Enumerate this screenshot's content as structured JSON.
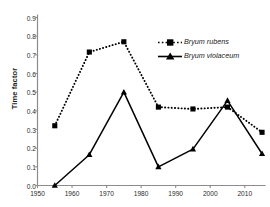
{
  "caption": {
    "top_fragment": ""
  },
  "chart_data": {
    "type": "line",
    "title": "",
    "subtitle": "",
    "xlabel": "",
    "ylabel": "Time factor",
    "xlim": [
      1950,
      2016
    ],
    "ylim": [
      0.0,
      0.9
    ],
    "grid": false,
    "legend_position": "upper-right-inside",
    "x_ticks": [
      "1950",
      "1960",
      "1970",
      "1980",
      "1990",
      "2000",
      "2010"
    ],
    "x_tick_values": [
      1950,
      1960,
      1970,
      1980,
      1990,
      2000,
      2010
    ],
    "y_ticks": [
      "0.0",
      "0.1",
      "0.2",
      "0.3",
      "0.4",
      "0.5",
      "0.6",
      "0.7",
      "0.8",
      "0.9"
    ],
    "y_tick_values": [
      0.0,
      0.1,
      0.2,
      0.3,
      0.4,
      0.5,
      0.6,
      0.7,
      0.8,
      0.9
    ],
    "x": [
      1955,
      1965,
      1975,
      1985,
      1995,
      2005,
      2015
    ],
    "series": [
      {
        "name": "Bryum rubens",
        "values": [
          0.32,
          0.715,
          0.77,
          0.42,
          0.41,
          0.42,
          0.285
        ],
        "line_style": "dotted",
        "marker": "square",
        "color": "#000000"
      },
      {
        "name": "Bryum violaceum",
        "values": [
          0.0,
          0.165,
          0.5,
          0.1,
          0.195,
          0.455,
          0.17
        ],
        "line_style": "solid",
        "marker": "triangle",
        "color": "#000000"
      }
    ]
  },
  "axes": {
    "y_label": "Time factor"
  },
  "legend": {
    "items": [
      {
        "label": "Bryum rubens"
      },
      {
        "label": "Bryum violaceum"
      }
    ]
  }
}
